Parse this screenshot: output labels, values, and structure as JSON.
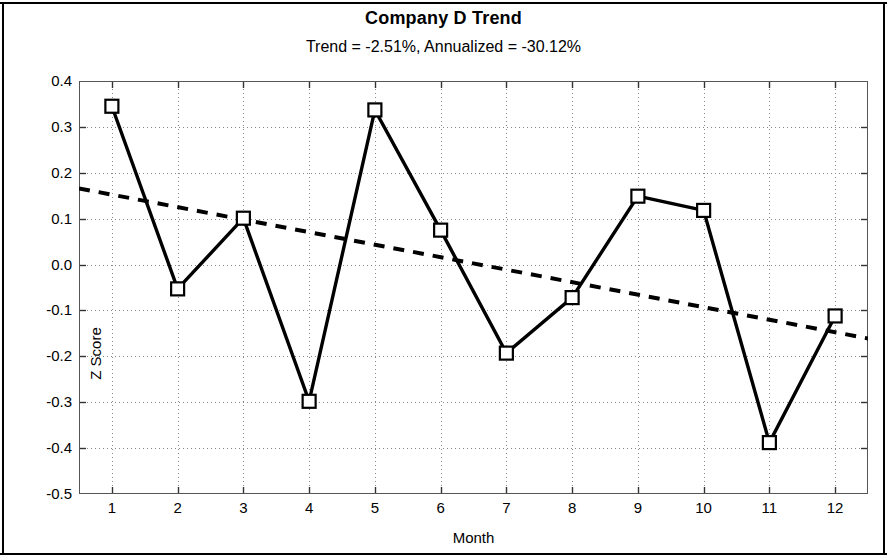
{
  "chart_data": {
    "type": "line",
    "title": "Company D Trend",
    "subtitle": "Trend = -2.51%,  Annualized = -30.12%",
    "xlabel": "Month",
    "ylabel": "Z Score",
    "x": [
      1,
      2,
      3,
      4,
      5,
      6,
      7,
      8,
      9,
      10,
      11,
      12
    ],
    "xtick_labels": [
      "1",
      "2",
      "3",
      "4",
      "5",
      "6",
      "7",
      "8",
      "9",
      "10",
      "11",
      "12"
    ],
    "ytick_labels": [
      "0.4",
      "0.3",
      "0.2",
      "0.1",
      "0.0",
      "-0.1",
      "-0.2",
      "-0.3",
      "-0.4",
      "-0.5"
    ],
    "ytick_values": [
      0.4,
      0.3,
      0.2,
      0.1,
      0.0,
      -0.1,
      -0.2,
      -0.3,
      -0.4,
      -0.5
    ],
    "xlim": [
      0.5,
      12.5
    ],
    "ylim": [
      -0.5,
      0.4
    ],
    "grid": true,
    "legend": "none",
    "series": [
      {
        "name": "Z Score",
        "style": "solid-line-open-square-markers",
        "color": "#000000",
        "values": [
          0.345,
          -0.053,
          0.101,
          -0.298,
          0.337,
          0.075,
          -0.193,
          -0.072,
          0.149,
          0.118,
          -0.388,
          -0.112
        ]
      },
      {
        "name": "Trend line",
        "style": "dotted",
        "color": "#000000",
        "x_endpoints": [
          0.5,
          12.5
        ],
        "y_endpoints": [
          0.166,
          -0.161
        ]
      }
    ]
  },
  "axis": {
    "title": "Company D Trend",
    "subtitle": "Trend = -2.51%,  Annualized = -30.12%",
    "x_title": "Month",
    "y_title": "Z Score"
  }
}
